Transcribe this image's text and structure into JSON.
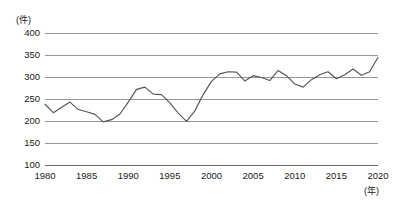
{
  "chart_data": {
    "type": "line",
    "title": "",
    "xlabel": "(年)",
    "ylabel": "(件)",
    "xlim": [
      1980,
      2020
    ],
    "ylim": [
      100,
      400
    ],
    "grid": true,
    "legend": null,
    "x_tick_labels": [
      "1980",
      "1985",
      "1990",
      "1995",
      "2000",
      "2005",
      "2010",
      "2015",
      "2020"
    ],
    "x_ticks": [
      1980,
      1985,
      1990,
      1995,
      2000,
      2005,
      2010,
      2015,
      2020
    ],
    "y_tick_labels": [
      "400",
      "350",
      "300",
      "250",
      "200",
      "150",
      "100"
    ],
    "y_ticks": [
      400,
      350,
      300,
      250,
      200,
      150,
      100
    ],
    "series": [
      {
        "name": "件数",
        "x": [
          1980,
          1981,
          1982,
          1983,
          1984,
          1985,
          1986,
          1987,
          1988,
          1989,
          1990,
          1991,
          1992,
          1993,
          1994,
          1995,
          1996,
          1997,
          1998,
          1999,
          2000,
          2001,
          2002,
          2003,
          2004,
          2005,
          2006,
          2007,
          2008,
          2009,
          2010,
          2011,
          2012,
          2013,
          2014,
          2015,
          2016,
          2017,
          2018,
          2019,
          2020
        ],
        "values": [
          238,
          219,
          231,
          243,
          226,
          221,
          215,
          198,
          203,
          216,
          243,
          272,
          277,
          261,
          260,
          241,
          218,
          199,
          223,
          260,
          290,
          307,
          312,
          311,
          291,
          303,
          299,
          292,
          315,
          303,
          284,
          277,
          294,
          305,
          312,
          296,
          305,
          318,
          304,
          312,
          345
        ]
      }
    ]
  },
  "caption": {
    "text": ""
  }
}
